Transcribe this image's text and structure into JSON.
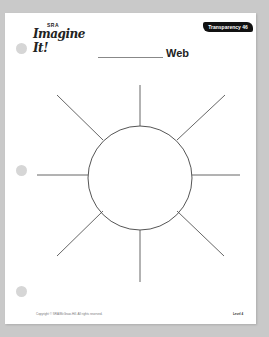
{
  "document": {
    "logo": {
      "top_text": "SRA",
      "main_text": "Imagine It!"
    },
    "badge": "Transparency 46",
    "title": {
      "blank_line": "",
      "label": "Web"
    },
    "web_diagram": {
      "center": {
        "x": 140,
        "y": 178,
        "r": 52
      },
      "spokes": 8
    },
    "footer": {
      "copyright": "Copyright © SRA/McGraw-Hill. All rights reserved.",
      "level": "Level 4"
    }
  }
}
